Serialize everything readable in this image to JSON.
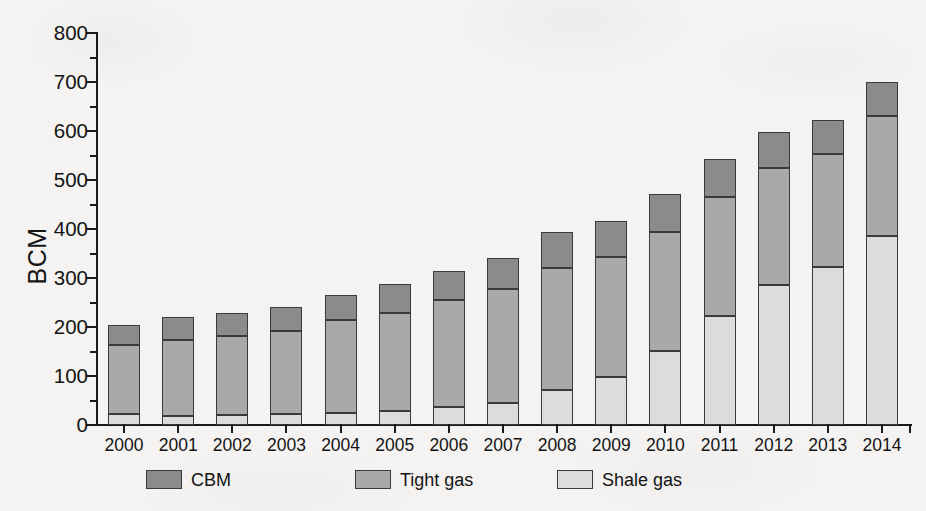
{
  "chart_data": {
    "type": "bar",
    "subtype": "stacked-bar",
    "title": "",
    "xlabel": "",
    "ylabel": "BCM",
    "ylim": [
      0,
      800
    ],
    "ytick_step": 100,
    "yminor_step": 50,
    "grid": false,
    "legend_position": "bottom",
    "ytick_labels": [
      "0",
      "100",
      "200",
      "300",
      "400",
      "500",
      "600",
      "700",
      "800"
    ],
    "categories": [
      "2000",
      "2001",
      "2002",
      "2003",
      "2004",
      "2005",
      "2006",
      "2007",
      "2008",
      "2009",
      "2010",
      "2011",
      "2012",
      "2013",
      "2014"
    ],
    "series": [
      {
        "name": "Shale gas",
        "color": "#dcdcda",
        "stack_order": 0,
        "values": [
          22,
          18,
          20,
          22,
          24,
          28,
          36,
          45,
          72,
          99,
          151,
          223,
          285,
          322,
          385
        ]
      },
      {
        "name": "Tight gas",
        "color": "#a9a9a7",
        "stack_order": 1,
        "values": [
          142,
          155,
          162,
          170,
          190,
          200,
          219,
          233,
          248,
          244,
          243,
          243,
          240,
          232,
          245
        ]
      },
      {
        "name": "CBM",
        "color": "#8b8b89",
        "stack_order": 2,
        "values": [
          40,
          47,
          46,
          48,
          51,
          60,
          60,
          63,
          73,
          74,
          78,
          77,
          74,
          68,
          70
        ]
      }
    ],
    "totals": [
      204,
      220,
      228,
      240,
      265,
      288,
      315,
      341,
      393,
      417,
      472,
      543,
      599,
      622,
      700
    ]
  },
  "legend": {
    "items": [
      {
        "label": "CBM",
        "color": "#8b8b89"
      },
      {
        "label": "Tight gas",
        "color": "#a9a9a7"
      },
      {
        "label": "Shale gas",
        "color": "#dcdcda"
      }
    ]
  },
  "axis": {
    "y_title": "BCM"
  }
}
